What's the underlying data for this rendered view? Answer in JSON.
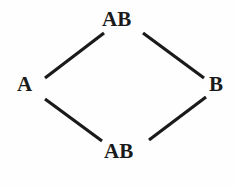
{
  "diagram": {
    "type": "lattice-hasse-diagram",
    "shape": "diamond",
    "background_color": "#fefefe",
    "edge_color": "#1a1a1a",
    "label_color": "#1a1a1a",
    "nodes": [
      {
        "id": "top",
        "label": "AB",
        "x": 121,
        "y": 19
      },
      {
        "id": "left",
        "label": "A",
        "x": 26,
        "y": 84
      },
      {
        "id": "right",
        "label": "B",
        "x": 216,
        "y": 84
      },
      {
        "id": "bottom",
        "label": "AB",
        "x": 123,
        "y": 151
      }
    ],
    "edges": [
      {
        "id": "left-to-top",
        "from": "left",
        "to": "top",
        "x1": 45,
        "y1": 78,
        "x2": 104,
        "y2": 33
      },
      {
        "id": "top-to-right",
        "from": "top",
        "to": "right",
        "x1": 143,
        "y1": 33,
        "x2": 204,
        "y2": 78
      },
      {
        "id": "left-to-bottom",
        "from": "left",
        "to": "bottom",
        "x1": 45,
        "y1": 99,
        "x2": 102,
        "y2": 141
      },
      {
        "id": "bottom-to-right",
        "from": "bottom",
        "to": "right",
        "x1": 149,
        "y1": 140,
        "x2": 206,
        "y2": 97
      }
    ],
    "edge_width": 3.2
  }
}
